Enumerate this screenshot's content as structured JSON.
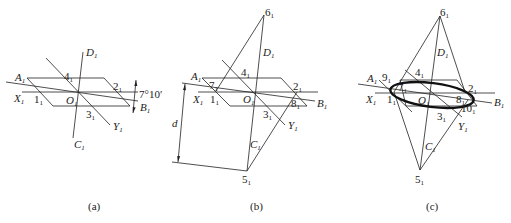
{
  "figure": {
    "panels": [
      {
        "id": "a",
        "caption": "(a)",
        "angle_label": "7°10′",
        "labels": {
          "A": "A",
          "B": "B",
          "C": "C",
          "D": "D",
          "X": "X",
          "Y": "Y",
          "O": "O",
          "p1": "1",
          "p2": "2",
          "p3": "3",
          "p4": "4"
        }
      },
      {
        "id": "b",
        "caption": "(b)",
        "distance_label": "d",
        "labels": {
          "A": "A",
          "B": "B",
          "C": "C",
          "D": "D",
          "X": "X",
          "Y": "Y",
          "O": "O",
          "p1": "1",
          "p2": "2",
          "p3": "3",
          "p4": "4",
          "p5": "5",
          "p6": "6",
          "p7": "7",
          "p8": "8"
        }
      },
      {
        "id": "c",
        "caption": "(c)",
        "labels": {
          "A": "A",
          "B": "B",
          "C": "C",
          "D": "D",
          "X": "X",
          "Y": "Y",
          "O": "O",
          "p1": "1",
          "p2": "2",
          "p3": "3",
          "p4": "4",
          "p5": "5",
          "p6": "6",
          "p7": "7",
          "p8": "8",
          "p9": "9",
          "p10": "10"
        }
      }
    ],
    "subscript": "1"
  }
}
